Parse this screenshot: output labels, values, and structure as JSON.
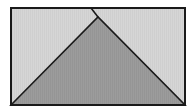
{
  "diagram": {
    "colors": {
      "background": "#ffffff",
      "rect_fill": "#d4d4d4",
      "triangle_fill": "#9a9a9a",
      "stroke": "#1a1a1a"
    },
    "rectangle": {
      "x": 11,
      "y": 8,
      "width": 174,
      "height": 97
    },
    "triangle": {
      "points": [
        [
          11,
          105
        ],
        [
          98,
          17
        ],
        [
          185,
          105
        ]
      ]
    },
    "apex_line": {
      "x1": 91,
      "y1": 8,
      "x2": 98,
      "y2": 17
    }
  }
}
